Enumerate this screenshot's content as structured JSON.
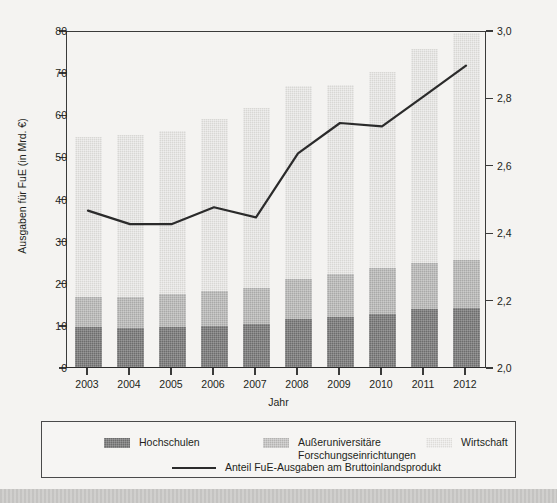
{
  "chart_data": {
    "type": "bar",
    "title": "",
    "xlabel": "Jahr",
    "ylabel": "Ausgaben für FuE (in Mrd. €)",
    "y2label": "Anteil der FuE-Ausgaben am Bruttoinlandsprodukt (in Prozent)",
    "categories": [
      "2003",
      "2004",
      "2005",
      "2006",
      "2007",
      "2008",
      "2009",
      "2010",
      "2011",
      "2012"
    ],
    "ylim": [
      0,
      80
    ],
    "yticks": [
      0,
      10,
      20,
      30,
      40,
      50,
      60,
      70,
      80
    ],
    "ytick_labels": [
      "0",
      "10",
      "20",
      "30",
      "40",
      "50",
      "60",
      "70",
      "80"
    ],
    "y2lim": [
      2.0,
      3.0
    ],
    "y2ticks": [
      2.0,
      2.2,
      2.4,
      2.6,
      2.8,
      3.0
    ],
    "y2tick_labels": [
      "2,0",
      "2,2",
      "2,4",
      "2,6",
      "2,8",
      "3,0"
    ],
    "grid": false,
    "stacked": true,
    "series": [
      {
        "name": "Hochschulen",
        "color": "#6d6d6d",
        "axis": "left",
        "values": [
          9.4,
          9.3,
          9.5,
          9.8,
          10.2,
          11.3,
          11.9,
          12.7,
          13.8,
          14.0
        ]
      },
      {
        "name": "Außeruniversitäre Forschungseinrichtungen",
        "color": "#a9a9a8",
        "axis": "left",
        "values": [
          7.3,
          7.4,
          7.9,
          8.2,
          8.6,
          9.5,
          10.3,
          10.9,
          11.0,
          11.5
        ]
      },
      {
        "name": "Wirtschaft",
        "color": "#d8d7d4",
        "axis": "left",
        "values": [
          38.0,
          38.4,
          38.6,
          40.9,
          42.7,
          45.8,
          44.8,
          46.4,
          50.7,
          53.9
        ]
      }
    ],
    "totals": [
      54.7,
      55.1,
      56.0,
      58.9,
      61.5,
      66.6,
      67.0,
      70.0,
      75.5,
      79.4
    ],
    "line_series": {
      "name": "Anteil FuE-Ausgaben am Bruttoinlandsprodukt",
      "color": "#2b2b2b",
      "axis": "right",
      "values": [
        2.47,
        2.43,
        2.43,
        2.48,
        2.45,
        2.64,
        2.73,
        2.72,
        2.81,
        2.9
      ]
    },
    "legend_position": "bottom"
  },
  "legend": {
    "items": [
      {
        "label": "Hochschulen",
        "swatch": "s0"
      },
      {
        "label": "Außeruniversitäre\nForschungseinrichtungen",
        "swatch": "s1"
      },
      {
        "label": "Wirtschaft",
        "swatch": "s2"
      }
    ],
    "line_item": {
      "label": "Anteil FuE-Ausgaben am Bruttoinlandsprodukt"
    }
  }
}
